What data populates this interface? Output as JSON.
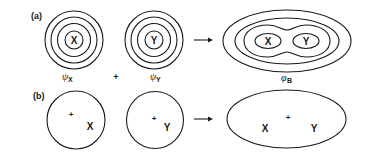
{
  "panel_a": {
    "label": "(a)",
    "atom_x": {
      "symbol": "X",
      "wavefunction": "ψ",
      "subscript": "X"
    },
    "atom_y": {
      "symbol": "Y",
      "wavefunction": "ψ",
      "subscript": "Y"
    },
    "plus": "+",
    "result": {
      "symbol_x": "X",
      "symbol_y": "Y",
      "wavefunction": "φ",
      "subscript": "B"
    }
  },
  "panel_b": {
    "label": "(b)",
    "atom_x": {
      "symbol": "X",
      "nucleus": "+"
    },
    "atom_y": {
      "symbol": "Y",
      "nucleus": "+"
    },
    "result": {
      "symbol_x": "X",
      "symbol_y": "Y",
      "center": "+"
    }
  },
  "colors": {
    "ink": "#1a1a1a",
    "background": "#ffffff"
  }
}
